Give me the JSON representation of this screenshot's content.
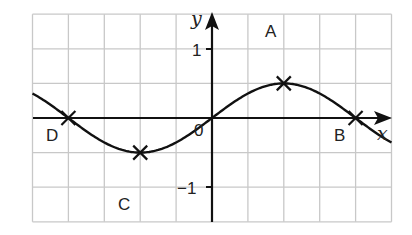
{
  "diagram": {
    "type": "function-graph",
    "function": "y = sin(pi*x/4)",
    "grid": {
      "x_min": -5,
      "x_max": 5,
      "y_min": -3,
      "y_max": 3,
      "grid_color": "#c8c8c8",
      "curve_color": "#111111"
    },
    "axes": {
      "x_label": "x",
      "y_label": "y",
      "origin_label": "0",
      "y_tick_labels": [
        {
          "value": 1,
          "text": "1"
        },
        {
          "value": -1,
          "text": "−1"
        }
      ]
    },
    "points": [
      {
        "name": "A",
        "x": 2,
        "y": 1
      },
      {
        "name": "B",
        "x": 4,
        "y": 0
      },
      {
        "name": "C",
        "x": -2,
        "y": -1
      },
      {
        "name": "D",
        "x": -4,
        "y": 0
      }
    ]
  },
  "chart_data": {
    "type": "line",
    "title": "",
    "xlabel": "x",
    "ylabel": "y",
    "xlim": [
      -5,
      5
    ],
    "ylim": [
      -3,
      3
    ],
    "grid": true,
    "series": [
      {
        "name": "curve",
        "x": [
          -5,
          -4,
          -3,
          -2,
          -1,
          0,
          1,
          2,
          3,
          4,
          5
        ],
        "values": [
          0.71,
          0,
          -0.71,
          -1,
          -0.71,
          0,
          0.71,
          1,
          0.71,
          0,
          -0.71
        ]
      }
    ],
    "annotations": [
      {
        "text": "A",
        "x": 2,
        "y": 1
      },
      {
        "text": "B",
        "x": 4,
        "y": 0
      },
      {
        "text": "C",
        "x": -2,
        "y": -1
      },
      {
        "text": "D",
        "x": -4,
        "y": 0
      },
      {
        "text": "0",
        "x": 0,
        "y": 0
      },
      {
        "text": "1",
        "x": 0,
        "y": 1
      },
      {
        "text": "−1",
        "x": 0,
        "y": -1
      }
    ]
  }
}
